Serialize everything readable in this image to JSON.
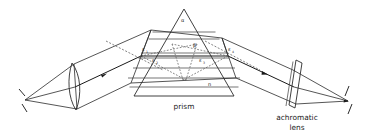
{
  "figure": {
    "background_color": "#ffffff",
    "line_color": "#2b2b2b",
    "width": 371,
    "height": 135
  },
  "captions": {
    "prism": "prism",
    "lens_line1": "achromatic",
    "lens_line2": "lens"
  },
  "angles": {
    "apex": "α",
    "beta": "β",
    "eps1_base": "ε",
    "eps1_sub": "1",
    "eps2_base": "ε",
    "eps2_sub": "2",
    "eps3_base": "ε",
    "eps3_sub": "3",
    "eps4_base": "ε",
    "eps4_sub": "4",
    "index": "n"
  },
  "components": {
    "source_slit": "slit-source",
    "collimator_lens": "collimator-lens",
    "prism_body": "prism-triangle",
    "achromatic_lens": "achromatic-lens",
    "focal_screen": "focal-screen"
  }
}
